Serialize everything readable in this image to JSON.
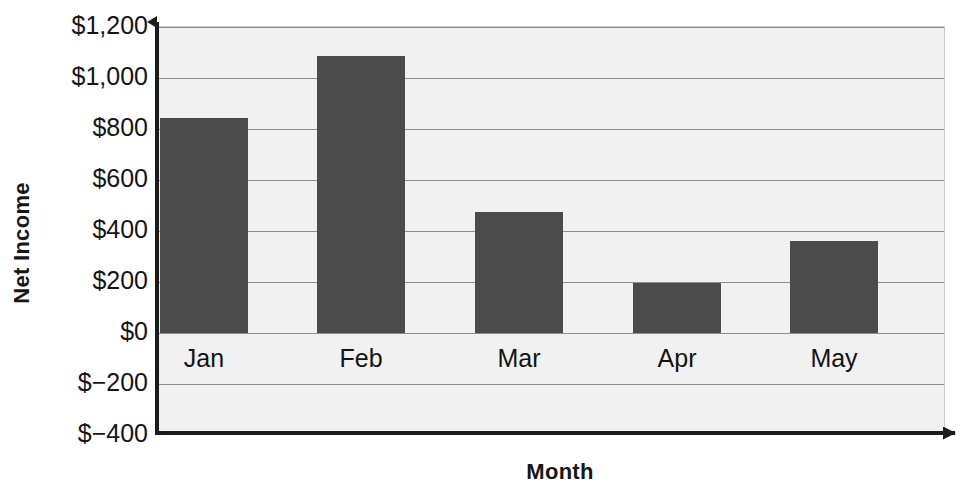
{
  "chart_data": {
    "type": "bar",
    "title": "",
    "xlabel": "Month",
    "ylabel": "Net Income",
    "categories": [
      "Jan",
      "Feb",
      "Mar",
      "Apr",
      "May"
    ],
    "values": [
      845,
      1085,
      475,
      195,
      360
    ],
    "series": [
      {
        "name": "Net Income",
        "values": [
          845,
          1085,
          475,
          195,
          360
        ]
      }
    ],
    "ylim": [
      -400,
      1200
    ],
    "ytick_values": [
      1200,
      1000,
      800,
      600,
      400,
      200,
      0,
      -200,
      -400
    ],
    "ytick_labels": [
      "$1,200",
      "$1,000",
      "$800",
      "$600",
      "$400",
      "$200",
      "$0",
      "$−200",
      "$−400"
    ],
    "grid": true,
    "legend": false,
    "legend_position": "none",
    "annotations": [],
    "bar_color": "#4b4b4b",
    "plot_background": "#f1f1f1",
    "gridline_color": "#8d8d8d",
    "axis_color": "#1c1c1c"
  }
}
